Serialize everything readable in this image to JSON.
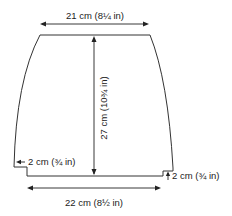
{
  "diagram": {
    "dimensions": {
      "top_width": "21 cm (8¼ in)",
      "bottom_width": "22 cm (8½ in)",
      "height": "27 cm (10¾ in)",
      "left_step": "2 cm (¾ in)",
      "right_step": "2 cm (¾ in)"
    },
    "colors": {
      "line": "#333333",
      "text": "#222222",
      "background": "#ffffff"
    }
  }
}
